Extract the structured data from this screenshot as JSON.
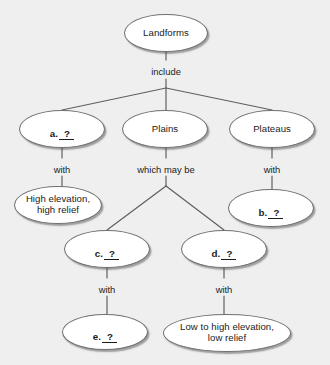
{
  "diagram": {
    "background_color": "#efefef",
    "node_fill_color": "#ffffff",
    "node_border_color": "#6f6f6f",
    "text_color": "#1b1b1b",
    "nodes": [
      {
        "id": "landforms",
        "label": "Landforms",
        "kind": "term",
        "x": 124,
        "y": 14,
        "w": 84,
        "h": 38
      },
      {
        "id": "a_blank",
        "label": "a.",
        "blank": "?",
        "kind": "blank",
        "x": 19,
        "y": 110,
        "w": 86,
        "h": 38
      },
      {
        "id": "plains",
        "label": "Plains",
        "kind": "term",
        "x": 122,
        "y": 110,
        "w": 86,
        "h": 38
      },
      {
        "id": "plateaus",
        "label": "Plateaus",
        "kind": "term",
        "x": 229,
        "y": 110,
        "w": 86,
        "h": 38
      },
      {
        "id": "high_relief",
        "label": "High elevation,\nhigh relief",
        "kind": "term",
        "x": 14,
        "y": 186,
        "w": 88,
        "h": 38
      },
      {
        "id": "b_blank",
        "label": "b.",
        "blank": "?",
        "kind": "blank",
        "x": 228,
        "y": 189,
        "w": 86,
        "h": 38
      },
      {
        "id": "c_blank",
        "label": "c.",
        "blank": "?",
        "kind": "blank",
        "x": 64,
        "y": 230,
        "w": 86,
        "h": 38
      },
      {
        "id": "d_blank",
        "label": "d.",
        "blank": "?",
        "kind": "blank",
        "x": 181,
        "y": 230,
        "w": 86,
        "h": 38
      },
      {
        "id": "e_blank",
        "label": "e.",
        "blank": "?",
        "kind": "blank",
        "x": 62,
        "y": 314,
        "w": 86,
        "h": 36
      },
      {
        "id": "low_relief",
        "label": "Low to high elevation,\nlow relief",
        "kind": "term",
        "x": 163,
        "y": 314,
        "w": 128,
        "h": 38
      }
    ],
    "edge_labels": [
      {
        "id": "include",
        "text": "include",
        "x": 166,
        "y": 66
      },
      {
        "id": "with_a",
        "text": "with",
        "x": 62,
        "y": 164
      },
      {
        "id": "which_may_be",
        "text": "which may be",
        "x": 166,
        "y": 164
      },
      {
        "id": "with_plateaus",
        "text": "with",
        "x": 272,
        "y": 164
      },
      {
        "id": "with_c",
        "text": "with",
        "x": 107,
        "y": 284
      },
      {
        "id": "with_d",
        "text": "with",
        "x": 224,
        "y": 284
      }
    ],
    "connectors": [
      {
        "id": "landforms-to-include",
        "points": "166,52 166,60"
      },
      {
        "id": "include-to-fan-apex",
        "points": "166,79 166,88"
      },
      {
        "id": "fan-include-left",
        "points": "166,88 62,110"
      },
      {
        "id": "fan-include-right",
        "points": "166,88 272,110"
      },
      {
        "id": "fan-include-center",
        "points": "166,88 166,110"
      },
      {
        "id": "a-to-with",
        "points": "62,148 62,158"
      },
      {
        "id": "with-to-high-relief",
        "points": "62,176 62,186"
      },
      {
        "id": "plains-to-whichmaybe",
        "points": "166,148 166,158"
      },
      {
        "id": "whichmaybe-to-fan-apex",
        "points": "166,176 166,186"
      },
      {
        "id": "fan-plains-left",
        "points": "166,186 107,230"
      },
      {
        "id": "fan-plains-right",
        "points": "166,186 224,230"
      },
      {
        "id": "plateaus-to-with",
        "points": "272,148 272,158"
      },
      {
        "id": "with-to-b",
        "points": "272,176 272,189"
      },
      {
        "id": "c-to-with",
        "points": "107,268 107,278"
      },
      {
        "id": "with-to-e",
        "points": "107,296 107,314"
      },
      {
        "id": "d-to-with",
        "points": "224,268 224,278"
      },
      {
        "id": "with-to-low-relief",
        "points": "224,296 224,314"
      }
    ]
  }
}
